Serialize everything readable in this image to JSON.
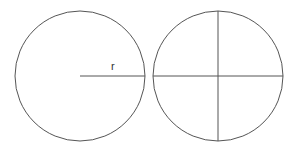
{
  "diagram": {
    "stroke_color": "#555555",
    "circles": [
      {
        "name": "circle-with-radius",
        "cx": 80,
        "cy": 76,
        "r": 65,
        "radius_label": "r"
      },
      {
        "name": "circle-quartered",
        "cx": 218,
        "cy": 76,
        "r": 65
      }
    ]
  }
}
